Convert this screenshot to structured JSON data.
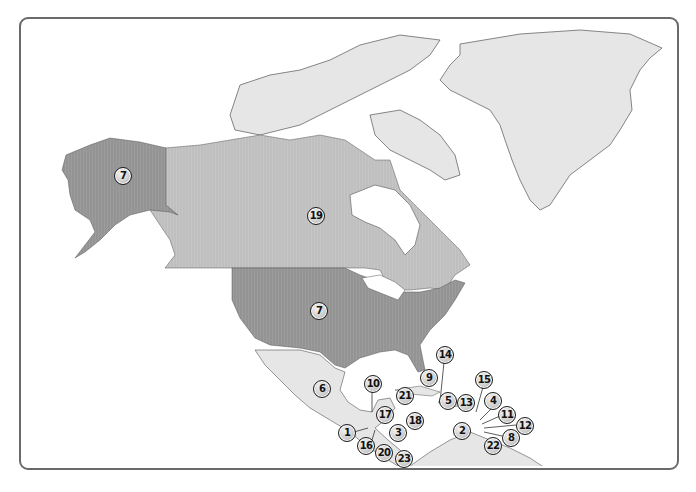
{
  "map": {
    "title": "North America and Caribbean numbered regions",
    "colors": {
      "frame_border": "#6a6a6a",
      "usa_alaska_fill": "#9a9a9a",
      "canada_fill": "#c4c4c4",
      "light_land_fill": "#e6e6e6",
      "coast_stroke": "#555555",
      "water": "#ffffff"
    },
    "regions": [
      {
        "name": "alaska",
        "label": "7"
      },
      {
        "name": "canada",
        "label": "19"
      },
      {
        "name": "contiguous-usa",
        "label": "7"
      },
      {
        "name": "mexico",
        "label": "6"
      },
      {
        "name": "greenland",
        "label": ""
      }
    ],
    "markers": [
      {
        "id": "alaska",
        "label": "7",
        "x": 122,
        "y": 175
      },
      {
        "id": "canada",
        "label": "19",
        "x": 315,
        "y": 215
      },
      {
        "id": "usa",
        "label": "7",
        "x": 318,
        "y": 310
      },
      {
        "id": "mexico",
        "label": "6",
        "x": 321,
        "y": 388
      },
      {
        "id": "m10",
        "label": "10",
        "x": 372,
        "y": 383
      },
      {
        "id": "m14",
        "label": "14",
        "x": 444,
        "y": 354
      },
      {
        "id": "m9",
        "label": "9",
        "x": 428,
        "y": 377
      },
      {
        "id": "m21",
        "label": "21",
        "x": 404,
        "y": 395
      },
      {
        "id": "m5",
        "label": "5",
        "x": 447,
        "y": 400
      },
      {
        "id": "m13",
        "label": "13",
        "x": 465,
        "y": 402
      },
      {
        "id": "m15",
        "label": "15",
        "x": 483,
        "y": 379
      },
      {
        "id": "m4",
        "label": "4",
        "x": 492,
        "y": 400
      },
      {
        "id": "m11",
        "label": "11",
        "x": 506,
        "y": 414
      },
      {
        "id": "m12",
        "label": "12",
        "x": 524,
        "y": 425
      },
      {
        "id": "m8",
        "label": "8",
        "x": 510,
        "y": 437
      },
      {
        "id": "m2",
        "label": "2",
        "x": 461,
        "y": 430
      },
      {
        "id": "m22",
        "label": "22",
        "x": 492,
        "y": 445
      },
      {
        "id": "m17",
        "label": "17",
        "x": 384,
        "y": 414
      },
      {
        "id": "m18",
        "label": "18",
        "x": 414,
        "y": 420
      },
      {
        "id": "m3",
        "label": "3",
        "x": 397,
        "y": 432
      },
      {
        "id": "m1",
        "label": "1",
        "x": 346,
        "y": 432
      },
      {
        "id": "m16",
        "label": "16",
        "x": 365,
        "y": 445
      },
      {
        "id": "m20",
        "label": "20",
        "x": 383,
        "y": 452
      },
      {
        "id": "m23",
        "label": "23",
        "x": 403,
        "y": 458
      }
    ]
  }
}
